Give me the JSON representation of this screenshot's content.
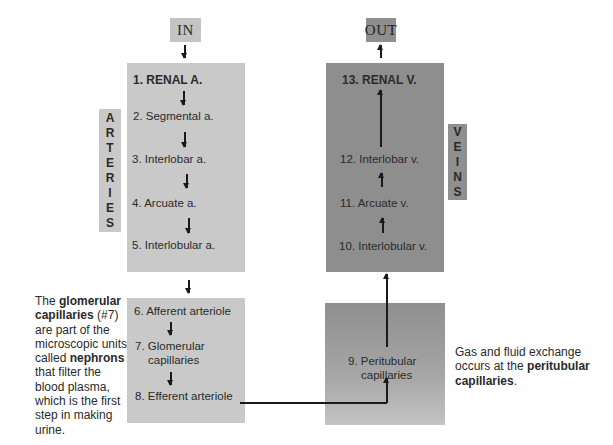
{
  "io": {
    "in_label": "IN",
    "out_label": "OUT"
  },
  "side_labels": {
    "arteries": [
      "A",
      "R",
      "T",
      "E",
      "R",
      "I",
      "E",
      "S"
    ],
    "veins": [
      "V",
      "E",
      "I",
      "N",
      "S"
    ]
  },
  "arteries": {
    "items": [
      "1. RENAL A.",
      "2. Segmental a.",
      "3. Interlobar a.",
      "4. Arcuate a.",
      "5. Interlobular a."
    ]
  },
  "arterioles": {
    "items": [
      "6. Afferent arteriole",
      "7. Glomerular",
      "capillaries",
      "8. Efferent arteriole"
    ]
  },
  "veins": {
    "items": [
      "13. RENAL V.",
      "12. Interlobar v.",
      "11. Arcuate v.",
      "10. Interlobular v."
    ]
  },
  "peritubular": {
    "line1": "9. Peritubular",
    "line2": "capillaries"
  },
  "left_note": {
    "parts": [
      {
        "t": "The ",
        "b": false
      },
      {
        "t": "glomerular capillaries",
        "b": true
      },
      {
        "t": " (#7) are part of the microscopic units called ",
        "b": false
      },
      {
        "t": "nephrons",
        "b": true
      },
      {
        "t": " that filter the blood plasma, which is the first step in making urine.",
        "b": false
      }
    ],
    "lines": [
      [
        {
          "t": "The ",
          "b": false
        },
        {
          "t": "glomerular",
          "b": true
        }
      ],
      [
        {
          "t": "capillaries",
          "b": true
        },
        {
          "t": " (#7)",
          "b": false
        }
      ],
      [
        {
          "t": "are part of the",
          "b": false
        }
      ],
      [
        {
          "t": "microscopic units",
          "b": false
        }
      ],
      [
        {
          "t": "called ",
          "b": false
        },
        {
          "t": "nephrons",
          "b": true
        }
      ],
      [
        {
          "t": "that filter the",
          "b": false
        }
      ],
      [
        {
          "t": "blood plasma,",
          "b": false
        }
      ],
      [
        {
          "t": "which is the first",
          "b": false
        }
      ],
      [
        {
          "t": "step in making",
          "b": false
        }
      ],
      [
        {
          "t": "urine.",
          "b": false
        }
      ]
    ]
  },
  "right_note": {
    "lines": [
      [
        {
          "t": "Gas and fluid exchange",
          "b": false
        }
      ],
      [
        {
          "t": "occurs at the ",
          "b": false
        },
        {
          "t": "peritubular",
          "b": true
        }
      ],
      [
        {
          "t": "capillaries",
          "b": true
        },
        {
          "t": ".",
          "b": false
        }
      ]
    ]
  }
}
